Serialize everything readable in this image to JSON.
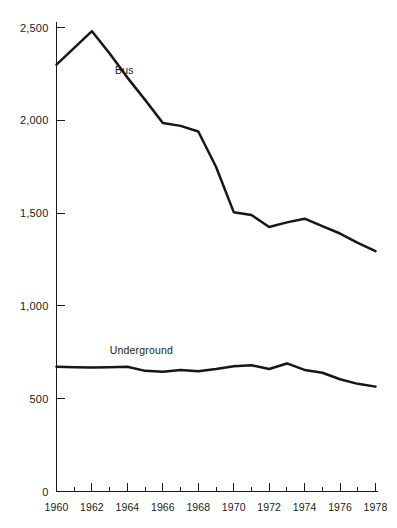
{
  "chart_data": {
    "type": "line",
    "title": "",
    "subtitle": "",
    "xlabel": "",
    "ylabel": "",
    "xlim": [
      1960,
      1978
    ],
    "ylim": [
      0,
      2500
    ],
    "grid": false,
    "legend_position": "inline-labels",
    "y_ticks": [
      0,
      500,
      1000,
      1500,
      2000,
      2500
    ],
    "y_tick_labels": [
      "0",
      "500",
      "1,000",
      "1,500",
      "2,000",
      "2,500"
    ],
    "x_ticks": [
      1960,
      1962,
      1964,
      1966,
      1968,
      1970,
      1972,
      1974,
      1976,
      1978
    ],
    "x_tick_labels": [
      "1960",
      "1962",
      "1964",
      "1966",
      "1968",
      "1970",
      "1972",
      "1974",
      "1976",
      "1978"
    ],
    "x_minor_ticks": [
      1961,
      1963,
      1965,
      1967,
      1969,
      1971,
      1973,
      1975,
      1977
    ],
    "x": [
      1960,
      1961,
      1962,
      1963,
      1964,
      1965,
      1966,
      1967,
      1968,
      1969,
      1970,
      1971,
      1972,
      1973,
      1974,
      1975,
      1976,
      1977,
      1978
    ],
    "series": [
      {
        "name": "Bus",
        "label": "Bus",
        "color": "#161616",
        "label_x": 1963.3,
        "label_y": 2250,
        "values": [
          2300,
          2390,
          2480,
          2360,
          2230,
          2110,
          1985,
          1970,
          1940,
          1750,
          1505,
          1490,
          1425,
          1450,
          1470,
          1430,
          1390,
          1340,
          1295
        ]
      },
      {
        "name": "Underground",
        "label": "Underground",
        "color": "#161616",
        "label_x": 1963.0,
        "label_y": 740,
        "values": [
          672,
          670,
          668,
          670,
          672,
          650,
          645,
          655,
          648,
          660,
          675,
          680,
          660,
          690,
          655,
          640,
          605,
          580,
          565
        ]
      }
    ]
  }
}
